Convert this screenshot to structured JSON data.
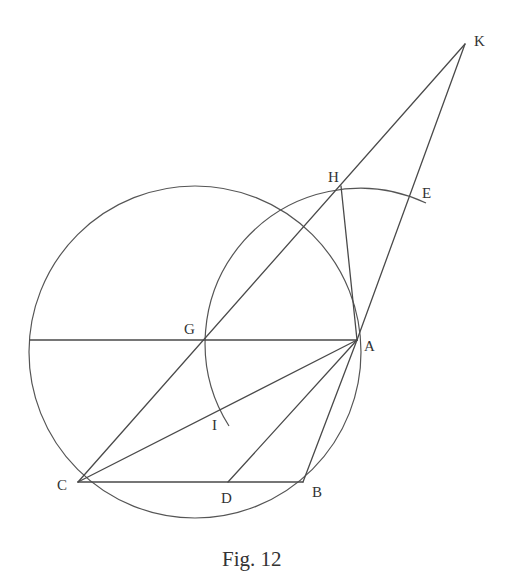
{
  "figure": {
    "caption": "Fig. 12",
    "stroke_color": "#4a4a4a",
    "background": "#ffffff"
  },
  "points": {
    "K": {
      "label": "K",
      "x": 465,
      "y": 44
    },
    "H": {
      "label": "H",
      "x": 341,
      "y": 186
    },
    "E": {
      "label": "E",
      "x": 410,
      "y": 195
    },
    "A": {
      "label": "A",
      "x": 357,
      "y": 340
    },
    "G": {
      "label": "G",
      "x": 203,
      "y": 340
    },
    "I": {
      "label": "I",
      "x": 229,
      "y": 426
    },
    "C": {
      "label": "C",
      "x": 78,
      "y": 482
    },
    "D": {
      "label": "D",
      "x": 228,
      "y": 482
    },
    "B": {
      "label": "B",
      "x": 303,
      "y": 482
    }
  },
  "labels": {
    "K": "K",
    "H": "H",
    "E": "E",
    "A": "A",
    "G": "G",
    "I": "I",
    "C": "C",
    "D": "D",
    "B": "B"
  },
  "segments": [
    [
      "C",
      "K"
    ],
    [
      "A",
      "K"
    ],
    [
      "A",
      "H"
    ],
    [
      "G",
      "A"
    ],
    [
      "C",
      "A"
    ],
    [
      "D",
      "A"
    ],
    [
      "B",
      "A"
    ],
    [
      "C",
      "B"
    ]
  ],
  "circles": [
    {
      "name": "main-circle",
      "cx": 195,
      "cy": 352,
      "r": 166
    }
  ],
  "arcs": [
    {
      "name": "arc-IHE",
      "center": "A",
      "radius": 155,
      "from": "I",
      "to": "E"
    }
  ]
}
